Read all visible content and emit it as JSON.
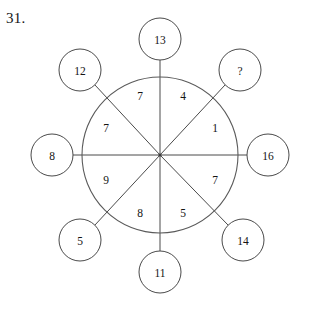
{
  "page": {
    "question_number": "31.",
    "background_color": "#ffffff",
    "line_color": "#4a4a4a",
    "text_color": "#141414"
  },
  "puzzle": {
    "type": "wheel-number-puzzle",
    "hub_center": {
      "x": 160,
      "y": 155
    },
    "wheel_radius": 78,
    "node_radius": 21,
    "missing_value_marker": "?",
    "inner_sectors": [
      {
        "id": "inner-n-ne",
        "label": "4",
        "x": 183,
        "y": 96,
        "angle_deg": -67.5
      },
      {
        "id": "inner-ne-e",
        "label": "1",
        "x": 215,
        "y": 128,
        "angle_deg": -22.5
      },
      {
        "id": "inner-e-se",
        "label": "7",
        "x": 215,
        "y": 180,
        "angle_deg": 22.5
      },
      {
        "id": "inner-se-s",
        "label": "5",
        "x": 183,
        "y": 213,
        "angle_deg": 67.5
      },
      {
        "id": "inner-s-sw",
        "label": "8",
        "x": 140,
        "y": 213,
        "angle_deg": 112.5
      },
      {
        "id": "inner-sw-w",
        "label": "9",
        "x": 106,
        "y": 180,
        "angle_deg": 157.5
      },
      {
        "id": "inner-w-nw",
        "label": "7",
        "x": 106,
        "y": 128,
        "angle_deg": 202.5
      },
      {
        "id": "inner-nw-n",
        "label": "7",
        "x": 140,
        "y": 96,
        "angle_deg": 247.5
      }
    ],
    "outer_nodes": [
      {
        "id": "node-top",
        "label": "13",
        "x": 160,
        "y": 39,
        "angle_deg": -90
      },
      {
        "id": "node-top-right",
        "label": "?",
        "x": 240,
        "y": 70,
        "angle_deg": -45
      },
      {
        "id": "node-right",
        "label": "16",
        "x": 268,
        "y": 155,
        "angle_deg": 0
      },
      {
        "id": "node-bottom-right",
        "label": "14",
        "x": 243,
        "y": 240,
        "angle_deg": 45
      },
      {
        "id": "node-bottom",
        "label": "11",
        "x": 160,
        "y": 272,
        "angle_deg": 90
      },
      {
        "id": "node-bottom-left",
        "label": "5",
        "x": 80,
        "y": 240,
        "angle_deg": 135
      },
      {
        "id": "node-left",
        "label": "8",
        "x": 52,
        "y": 155,
        "angle_deg": 180
      },
      {
        "id": "node-top-left",
        "label": "12",
        "x": 80,
        "y": 70,
        "angle_deg": 225
      }
    ],
    "spokes": [
      {
        "id": "spoke-vertical",
        "angle_deg": 90
      },
      {
        "id": "spoke-horizontal",
        "angle_deg": 0
      },
      {
        "id": "spoke-diag-down",
        "angle_deg": 45
      },
      {
        "id": "spoke-diag-up",
        "angle_deg": 135
      }
    ]
  }
}
